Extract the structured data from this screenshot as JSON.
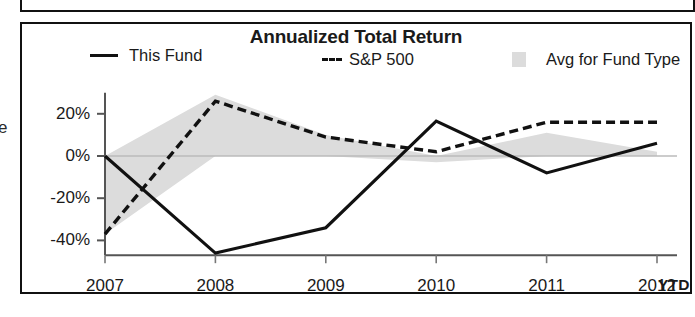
{
  "panel": {
    "title": "Annualized Total Return"
  },
  "margin_fragment": "e",
  "legend": {
    "items": [
      {
        "label": "This Fund",
        "marker": "solid-line-swatch",
        "color": "#111111"
      },
      {
        "label": "S&P 500",
        "marker": "dashed-line-swatch",
        "color": "#111111"
      },
      {
        "label": "Avg for Fund Type",
        "marker": "area-swatch",
        "color": "#dcdcdc"
      }
    ]
  },
  "axis": {
    "y_ticks": [
      "20%",
      "0%",
      "-20%",
      "-40%"
    ],
    "x_ticks": [
      "2007",
      "2008",
      "2009",
      "2010",
      "2011",
      "2012"
    ],
    "x_suffix": "YTD"
  },
  "chart_data": {
    "type": "line",
    "title": "Annualized Total Return",
    "xlabel": "",
    "ylabel": "",
    "categories": [
      "2007",
      "2008",
      "2009",
      "2010",
      "2011",
      "2012 YTD"
    ],
    "x": [
      2007,
      2008,
      2009,
      2010,
      2011,
      2012
    ],
    "ylim": [
      -47,
      30
    ],
    "ytick_values": [
      20,
      0,
      -20,
      -40
    ],
    "ytick_labels": [
      "20%",
      "0%",
      "-20%",
      "-40%"
    ],
    "grid": false,
    "legend_position": "top",
    "series": [
      {
        "name": "This Fund",
        "style": "solid",
        "color": "#111111",
        "values": [
          0,
          -46,
          -34,
          16.5,
          -8,
          6
        ]
      },
      {
        "name": "S&P 500",
        "style": "dashed",
        "color": "#111111",
        "values": [
          -37,
          26,
          9,
          2,
          16,
          16
        ]
      },
      {
        "name": "Avg for Fund Type",
        "style": "area-band",
        "color": "#dcdcdc",
        "upper": [
          0,
          29,
          10,
          0,
          11,
          2
        ],
        "lower": [
          -37,
          0,
          0,
          -3,
          0,
          0
        ]
      }
    ]
  }
}
